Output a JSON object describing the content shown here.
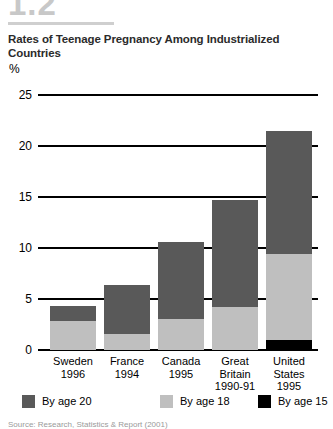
{
  "figure": {
    "number": "1.2"
  },
  "chart_data": {
    "type": "bar",
    "stacked": true,
    "title": "Rates of Teenage Pregnancy Among Industrialized Countries",
    "xlabel": "",
    "ylabel": "%",
    "ylim": [
      0,
      25
    ],
    "yticks": [
      "0",
      "5",
      "10",
      "15",
      "20",
      "25"
    ],
    "grid": true,
    "legend_position": "bottom",
    "categories": [
      "Sweden",
      "France",
      "Canada",
      "Great Britain",
      "United States"
    ],
    "category_labels": [
      {
        "country": "Sweden",
        "year": "1996",
        "year2": ""
      },
      {
        "country": "France",
        "year": "1994",
        "year2": ""
      },
      {
        "country": "Canada",
        "year": "1995",
        "year2": ""
      },
      {
        "country": "Great",
        "year": "Britain",
        "year2": "1990-91"
      },
      {
        "country": "United",
        "year": "States",
        "year2": "1995"
      }
    ],
    "series": [
      {
        "name": "By age 15",
        "color": "#000000",
        "values": [
          0,
          0,
          0,
          0,
          1.0
        ]
      },
      {
        "name": "By age 18",
        "color": "#bfbfbf",
        "values": [
          2.8,
          1.6,
          3.0,
          4.2,
          8.4
        ]
      },
      {
        "name": "By age 20",
        "color": "#595959",
        "values": [
          1.5,
          4.8,
          7.6,
          10.5,
          12.1
        ]
      }
    ],
    "totals": [
      4.3,
      6.4,
      10.6,
      14.7,
      21.5
    ],
    "legend": [
      {
        "label": "By age 20",
        "color": "#595959"
      },
      {
        "label": "By age 18",
        "color": "#bfbfbf"
      },
      {
        "label": "By age 15",
        "color": "#000000"
      }
    ]
  },
  "source": {
    "note": "Source: Research, Statistics & Report (2001)"
  }
}
